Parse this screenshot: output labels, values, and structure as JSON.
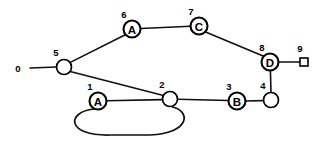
{
  "diagram": {
    "width": 327,
    "height": 142,
    "background_color": "#ffffff",
    "stroke_color": "#111111",
    "node_fill": "#ffffff"
  },
  "nodes": [
    {
      "id": "0",
      "index_label": "0",
      "letter": "",
      "shape": "none",
      "cx": 30,
      "cy": 68,
      "r": 0,
      "index_x": 18,
      "index_y": 68
    },
    {
      "id": "1",
      "index_label": "1",
      "letter": "A",
      "shape": "circle",
      "cx": 98,
      "cy": 101,
      "r": 8.5,
      "index_x": 90,
      "index_y": 86
    },
    {
      "id": "2",
      "index_label": "2",
      "letter": "",
      "shape": "circle",
      "cx": 170,
      "cy": 99,
      "r": 7.5,
      "index_x": 162,
      "index_y": 84
    },
    {
      "id": "3",
      "index_label": "3",
      "letter": "B",
      "shape": "circle",
      "cx": 237,
      "cy": 101,
      "r": 8.5,
      "index_x": 229,
      "index_y": 86
    },
    {
      "id": "4",
      "index_label": "4",
      "letter": "",
      "shape": "circle",
      "cx": 271,
      "cy": 100,
      "r": 7.5,
      "index_x": 263,
      "index_y": 85
    },
    {
      "id": "5",
      "index_label": "5",
      "letter": "",
      "shape": "circle",
      "cx": 64,
      "cy": 67,
      "r": 7.5,
      "index_x": 56,
      "index_y": 52
    },
    {
      "id": "6",
      "index_label": "6",
      "letter": "A",
      "shape": "circle",
      "cx": 132,
      "cy": 29,
      "r": 8.5,
      "index_x": 124,
      "index_y": 14
    },
    {
      "id": "7",
      "index_label": "7",
      "letter": "C",
      "shape": "circle",
      "cx": 199,
      "cy": 26,
      "r": 8.5,
      "index_x": 191,
      "index_y": 11
    },
    {
      "id": "8",
      "index_label": "8",
      "letter": "D",
      "shape": "circle",
      "cx": 270,
      "cy": 62,
      "r": 8.5,
      "index_x": 262,
      "index_y": 47
    },
    {
      "id": "9",
      "index_label": "9",
      "letter": "",
      "shape": "square",
      "cx": 304,
      "cy": 62,
      "r": 4,
      "index_x": 300,
      "index_y": 48
    }
  ],
  "edges": [
    {
      "from": "0",
      "to": "5",
      "x1": 30,
      "y1": 68,
      "x2": 56.5,
      "y2": 67
    },
    {
      "from": "5",
      "to": "6",
      "x1": 69.8,
      "y1": 62.6,
      "x2": 125.8,
      "y2": 34.5
    },
    {
      "from": "6",
      "to": "7",
      "x1": 140.5,
      "y1": 28.5,
      "x2": 190.5,
      "y2": 26.3
    },
    {
      "from": "7",
      "to": "8",
      "x1": 205.6,
      "y1": 31.9,
      "x2": 264.3,
      "y2": 56.4
    },
    {
      "from": "8",
      "to": "9",
      "x1": 278.5,
      "y1": 62,
      "x2": 300,
      "y2": 62
    },
    {
      "from": "8",
      "to": "4",
      "x1": 270.4,
      "y1": 70.5,
      "x2": 271,
      "y2": 92.5
    },
    {
      "from": "4",
      "to": "3",
      "x1": 263.5,
      "y1": 100.6,
      "x2": 245.5,
      "y2": 101
    },
    {
      "from": "3",
      "to": "2",
      "x1": 228.5,
      "y1": 100.5,
      "x2": 177.5,
      "y2": 99.3
    },
    {
      "from": "2",
      "to": "1",
      "x1": 162.5,
      "y1": 99.6,
      "x2": 106.5,
      "y2": 100.8
    },
    {
      "from": "5",
      "to": "2",
      "x1": 70.2,
      "y1": 71.5,
      "x2": 163.5,
      "y2": 95.5
    }
  ],
  "loop_edge": {
    "from": "1",
    "to": "2",
    "path": "M 94 109 C 66 112, 66 136, 110 135 L 150 135 C 192 133, 190 110, 172 107"
  }
}
